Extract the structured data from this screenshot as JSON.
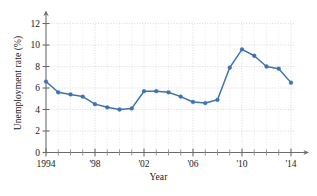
{
  "chart_data": {
    "type": "line",
    "title": "",
    "xlabel": "Year",
    "ylabel": "Unemployment rate (%)",
    "xlim": [
      1994,
      2014
    ],
    "ylim": [
      0,
      12
    ],
    "grid": true,
    "legend": false,
    "series_color": "#3a72b8",
    "x": [
      1994,
      1995,
      1996,
      1997,
      1998,
      1999,
      2000,
      2001,
      2002,
      2003,
      2004,
      2005,
      2006,
      2007,
      2008,
      2009,
      2010,
      2011,
      2012,
      2013,
      2014
    ],
    "values": [
      6.6,
      5.6,
      5.4,
      5.2,
      4.5,
      4.2,
      4.0,
      4.1,
      5.7,
      5.7,
      5.6,
      5.2,
      4.7,
      4.6,
      4.9,
      7.9,
      9.6,
      9.0,
      8.0,
      7.8,
      6.5
    ],
    "y_ticks": [
      0,
      2,
      4,
      6,
      8,
      10,
      12
    ],
    "y_tick_labels": [
      "0",
      "2",
      "4",
      "6",
      "8",
      "10",
      "12"
    ],
    "x_major_ticks": [
      1994,
      1998,
      2002,
      2006,
      2010,
      2014
    ],
    "x_tick_labels": [
      "1994",
      "'98",
      "'02",
      "'06",
      "'10",
      "'14"
    ],
    "x_minor_ticks": [
      1995,
      1996,
      1997,
      1999,
      2000,
      2001,
      2003,
      2004,
      2005,
      2007,
      2008,
      2009,
      2011,
      2012,
      2013
    ]
  }
}
